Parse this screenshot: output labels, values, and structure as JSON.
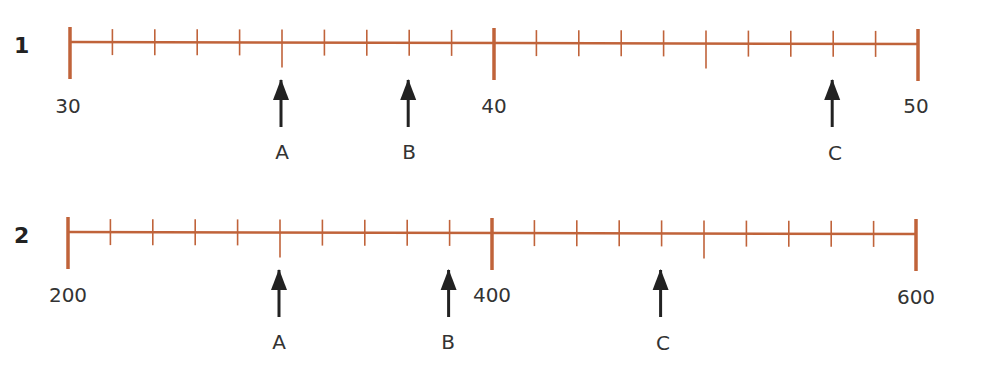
{
  "colors": {
    "line": "#c0633a",
    "arrow": "#222222",
    "text": "#333333"
  },
  "number_lines": [
    {
      "problem_number": "1",
      "start_value": 30,
      "end_value": 50,
      "intervals": 20,
      "step": 0.5,
      "labels": [
        {
          "text": "30",
          "tick": 0
        },
        {
          "text": "40",
          "tick": 10
        },
        {
          "text": "50",
          "tick": 20
        }
      ],
      "arrows": [
        {
          "label": "A",
          "tick": 5,
          "value": 32.5
        },
        {
          "label": "B",
          "tick": 8,
          "value": 34
        },
        {
          "label": "C",
          "tick": 18,
          "value": 49
        }
      ]
    },
    {
      "problem_number": "2",
      "start_value": 200,
      "end_value": 600,
      "intervals": 20,
      "step": 20,
      "labels": [
        {
          "text": "200",
          "tick": 0
        },
        {
          "text": "400",
          "tick": 10
        },
        {
          "text": "600",
          "tick": 20
        }
      ],
      "arrows": [
        {
          "label": "A",
          "tick": 5,
          "value": 300
        },
        {
          "label": "B",
          "tick": 9,
          "value": 380
        },
        {
          "label": "C",
          "tick": 14,
          "value": 480
        }
      ]
    }
  ]
}
